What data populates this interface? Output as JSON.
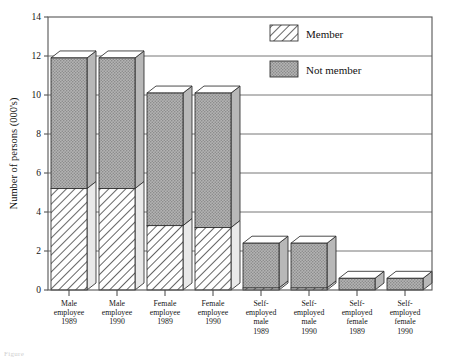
{
  "chart_data": {
    "type": "bar",
    "title": "",
    "subtitle": "",
    "xlabel": "",
    "ylabel": "Number of persons (000's)",
    "ylim": [
      0,
      14
    ],
    "ytick_labels": [
      "0",
      "2",
      "4",
      "6",
      "8",
      "10",
      "12",
      "14"
    ],
    "yticks": [
      0,
      2,
      4,
      6,
      8,
      10,
      12,
      14
    ],
    "grid": true,
    "grid_axis": "y",
    "stacked": true,
    "style": "3d-isometric",
    "legend_position": "upper-right-inside",
    "categories": [
      "Male employee 1989",
      "Male employee 1990",
      "Female employee 1989",
      "Female employee 1990",
      "Self-employed male 1989",
      "Self-employed male 1990",
      "Self-employed female 1989",
      "Self-employed female 1990"
    ],
    "category_label_lines": [
      [
        "Male",
        "employee",
        "1989"
      ],
      [
        "Male",
        "employee",
        "1990"
      ],
      [
        "Female",
        "employee",
        "1989"
      ],
      [
        "Female",
        "employee",
        "1990"
      ],
      [
        "Self-",
        "employed",
        "male",
        "1989"
      ],
      [
        "Self-",
        "employed",
        "male",
        "1990"
      ],
      [
        "Self-",
        "employed",
        "female",
        "1989"
      ],
      [
        "Self-",
        "employed",
        "female",
        "1990"
      ]
    ],
    "series": [
      {
        "name": "Member",
        "fill": "diagonal-hatch",
        "values": [
          5.2,
          5.2,
          3.3,
          3.2,
          0.1,
          0.1,
          0.0,
          0.0
        ]
      },
      {
        "name": "Not member",
        "fill": "gray-stipple",
        "values": [
          6.7,
          6.7,
          6.8,
          6.9,
          2.3,
          2.3,
          0.6,
          0.6
        ]
      }
    ],
    "totals": [
      11.9,
      11.9,
      10.1,
      10.1,
      2.4,
      2.4,
      0.6,
      0.6
    ]
  },
  "legend": {
    "entries": [
      {
        "label": "Member",
        "swatch": "diagonal-hatch"
      },
      {
        "label": "Not member",
        "swatch": "gray-stipple"
      }
    ]
  },
  "colors": {
    "not_member_fill": "#a9a9a9",
    "member_fill": "#ffffff",
    "hatch_stroke": "#333333",
    "outline": "#2b2b2b",
    "grid": "#666666",
    "text": "#151515",
    "background": "#ffffff"
  },
  "caption": {
    "text": "Figure"
  }
}
